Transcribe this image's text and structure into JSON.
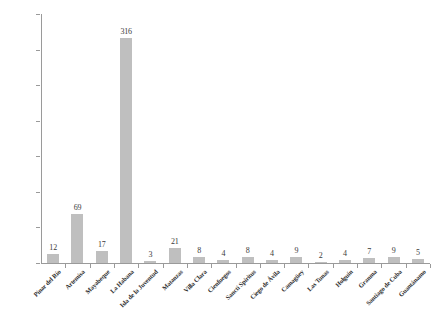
{
  "chart_data": {
    "type": "bar",
    "title": "",
    "subtitle": "",
    "xlabel": "",
    "ylabel": "",
    "ylim": [
      0,
      350
    ],
    "grid": false,
    "legend": null,
    "bar_color": "#bfbfbf",
    "axis_color": "#9a9a9a",
    "label_color": "#3a3a3a",
    "y_ticks": [
      0,
      50,
      100,
      150,
      200,
      250,
      300,
      350
    ],
    "categories": [
      "Pinar del Río",
      "Artemisa",
      "Mayabeque",
      "La Habana",
      "Isla de la Juventud",
      "Matanzas",
      "Villa Clara",
      "Cienfuegos",
      "Sancti Spíritus",
      "Ciego de Ávila",
      "Camagüey",
      "Las Tunas",
      "Holguín",
      "Granma",
      "Santiago de Cuba",
      "Guantánamo"
    ],
    "values": [
      12,
      69,
      17,
      316,
      3,
      21,
      8,
      4,
      8,
      4,
      9,
      2,
      4,
      7,
      9,
      5
    ]
  }
}
